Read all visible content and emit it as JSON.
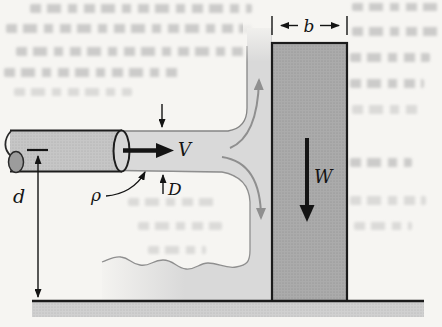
{
  "diagram": {
    "description": "Fluid jet from a horizontal pipe striking a vertical gate resting on the ground",
    "labels": {
      "velocity": "V",
      "diameter": "D",
      "density": "ρ",
      "height": "d",
      "gate_width": "b",
      "gate_weight": "W"
    }
  },
  "colors": {
    "paper": "#f6f5f2",
    "fluid": "#d9d9d9",
    "pipe": "#c6c6c6",
    "plate": "#aaaaaa",
    "ground": "#cecece",
    "flow_arrow": "#8f8f8f",
    "ink": "#141414"
  }
}
